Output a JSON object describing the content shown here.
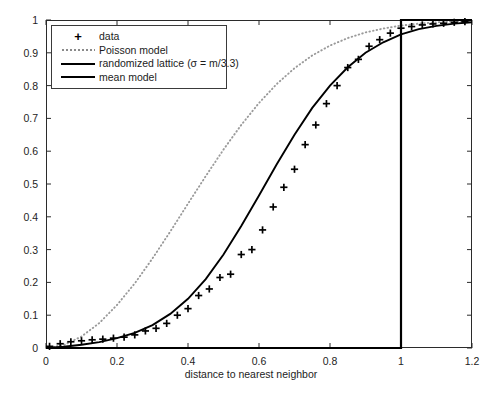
{
  "chart_data": {
    "type": "line",
    "title": "",
    "xlabel": "distance to nearest neighbor",
    "ylabel": "",
    "xlim": [
      0,
      1.2
    ],
    "ylim": [
      0,
      1
    ],
    "grid": false,
    "legend_position": "upper-left",
    "xticks": [
      "0",
      "0.2",
      "0.4",
      "0.6",
      "0.8",
      "1",
      "1.2"
    ],
    "xtick_values": [
      0,
      0.2,
      0.4,
      0.6,
      0.8,
      1.0,
      1.2
    ],
    "yticks": [
      "0",
      "0.1",
      "0.2",
      "0.3",
      "0.4",
      "0.5",
      "0.6",
      "0.7",
      "0.8",
      "0.9",
      "1"
    ],
    "ytick_values": [
      0,
      0.1,
      0.2,
      0.3,
      0.4,
      0.5,
      0.6,
      0.7,
      0.8,
      0.9,
      1.0
    ],
    "series": [
      {
        "name": "data",
        "style": "plus-markers",
        "color": "#000000",
        "x": [
          0.01,
          0.04,
          0.07,
          0.1,
          0.13,
          0.16,
          0.19,
          0.22,
          0.25,
          0.28,
          0.31,
          0.34,
          0.37,
          0.4,
          0.43,
          0.46,
          0.49,
          0.52,
          0.55,
          0.58,
          0.61,
          0.64,
          0.67,
          0.7,
          0.73,
          0.76,
          0.79,
          0.82,
          0.85,
          0.88,
          0.91,
          0.94,
          0.97,
          1.0,
          1.03,
          1.06,
          1.09,
          1.12,
          1.15,
          1.18
        ],
        "y": [
          0.005,
          0.013,
          0.019,
          0.022,
          0.025,
          0.027,
          0.03,
          0.033,
          0.04,
          0.052,
          0.06,
          0.075,
          0.1,
          0.12,
          0.16,
          0.18,
          0.215,
          0.225,
          0.285,
          0.3,
          0.36,
          0.43,
          0.49,
          0.545,
          0.62,
          0.68,
          0.745,
          0.8,
          0.855,
          0.88,
          0.92,
          0.94,
          0.96,
          0.975,
          0.98,
          0.985,
          0.988,
          0.99,
          0.993,
          0.995
        ]
      },
      {
        "name": "Poisson model",
        "style": "dotted",
        "color": "#9a9a9a",
        "x": [
          0.0,
          0.05,
          0.1,
          0.15,
          0.2,
          0.25,
          0.3,
          0.35,
          0.4,
          0.45,
          0.5,
          0.55,
          0.6,
          0.65,
          0.7,
          0.75,
          0.8,
          0.85,
          0.9,
          0.95,
          1.0,
          1.05,
          1.1,
          1.15,
          1.2
        ],
        "y": [
          0.0,
          0.009,
          0.035,
          0.076,
          0.131,
          0.197,
          0.273,
          0.355,
          0.44,
          0.524,
          0.605,
          0.68,
          0.747,
          0.805,
          0.853,
          0.892,
          0.922,
          0.945,
          0.962,
          0.974,
          0.983,
          0.989,
          0.993,
          0.996,
          0.998
        ]
      },
      {
        "name": "randomized lattice (σ = m/3.3)",
        "style": "solid",
        "color": "#000000",
        "x": [
          0.0,
          0.05,
          0.1,
          0.15,
          0.2,
          0.25,
          0.3,
          0.35,
          0.4,
          0.45,
          0.5,
          0.55,
          0.6,
          0.65,
          0.7,
          0.75,
          0.8,
          0.85,
          0.9,
          0.95,
          1.0,
          1.05,
          1.1,
          1.15,
          1.2
        ],
        "y": [
          0.0,
          0.004,
          0.01,
          0.018,
          0.03,
          0.046,
          0.07,
          0.104,
          0.15,
          0.21,
          0.285,
          0.372,
          0.465,
          0.56,
          0.65,
          0.732,
          0.8,
          0.856,
          0.9,
          0.932,
          0.956,
          0.972,
          0.982,
          0.989,
          0.993
        ]
      },
      {
        "name": "mean model",
        "style": "step",
        "color": "#000000",
        "x": [
          0.0,
          1.0,
          1.0,
          1.2
        ],
        "y": [
          0.0,
          0.0,
          1.0,
          1.0
        ]
      }
    ]
  },
  "legend": {
    "items": [
      {
        "label": "data",
        "key": "plus-marker"
      },
      {
        "label": "Poisson model",
        "key": "dotted-line"
      },
      {
        "label": "randomized lattice (σ = m/3.3)",
        "key": "solid-line"
      },
      {
        "label": "mean model",
        "key": "thick-solid-line"
      }
    ]
  },
  "colors": {
    "axis": "#2b2b2b",
    "data": "#000000",
    "poisson": "#9a9a9a",
    "lattice": "#000000",
    "mean": "#000000",
    "background": "#ffffff"
  }
}
